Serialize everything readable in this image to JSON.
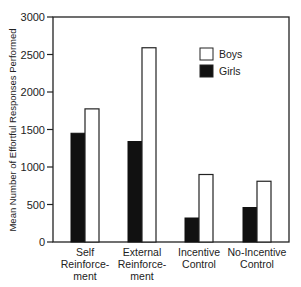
{
  "chart_data": {
    "type": "bar",
    "title": "",
    "xlabel": "",
    "ylabel": "Mean Number of Effortful Responses Performed",
    "ylim": [
      0,
      3000
    ],
    "yticks": [
      0,
      500,
      1000,
      1500,
      2000,
      2500,
      3000
    ],
    "grid": false,
    "legend_position": "upper right (inside plot)",
    "categories": [
      [
        "Self",
        "Reinforce-",
        "ment"
      ],
      [
        "External",
        "Reinforce-",
        "ment"
      ],
      [
        "Incentive",
        "Control"
      ],
      [
        "No-Incentive",
        "Control"
      ]
    ],
    "series": [
      {
        "name": "Girls",
        "color": "#111111",
        "values": [
          1450,
          1340,
          320,
          460
        ]
      },
      {
        "name": "Boys",
        "color": "#ffffff",
        "values": [
          1775,
          2590,
          900,
          810
        ]
      }
    ],
    "legend": [
      {
        "label": "Boys",
        "swatch": "#ffffff"
      },
      {
        "label": "Girls",
        "swatch": "#111111"
      }
    ]
  }
}
